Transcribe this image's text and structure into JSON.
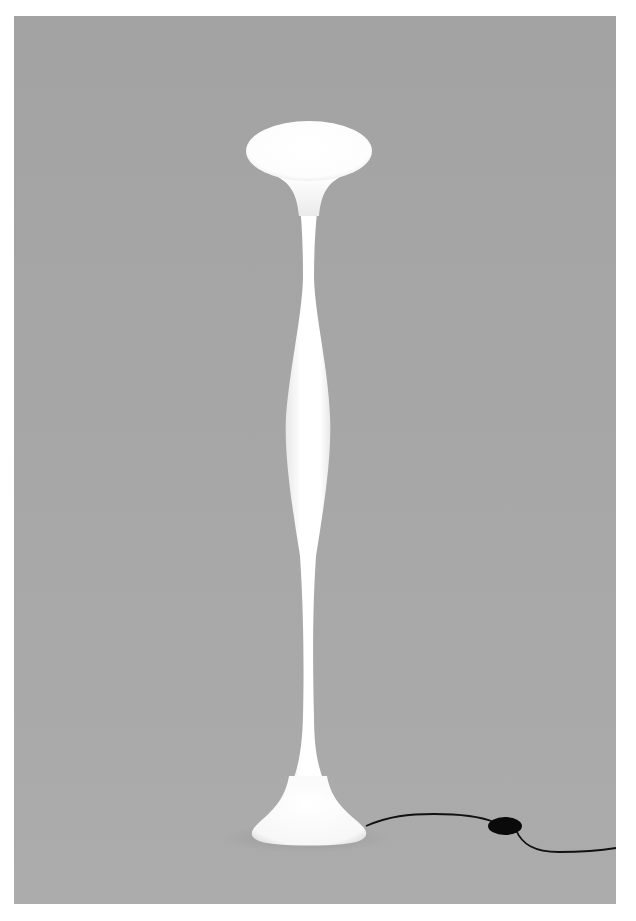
{
  "image": {
    "subject": "white sculptural floor lamp",
    "description": "Illuminated white floor lamp with an oval disc top, a slender bulging stem, a flared round base, and a black power cord with an inline round switch, photographed against a plain gray backdrop",
    "colors": {
      "page_background": "#ffffff",
      "backdrop": "#a6a6a6",
      "lamp_glow": "#ffffff",
      "lamp_shadow": "#d9d9d9",
      "cord": "#111111",
      "switch": "#0a0a0a"
    }
  }
}
